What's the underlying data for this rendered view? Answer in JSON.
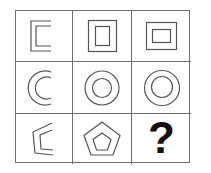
{
  "puzzle": {
    "type": "matrix-reasoning-3x3",
    "title": "",
    "grid": {
      "rows": 3,
      "columns": 3,
      "border_color": "#6e6e6e",
      "background_color": "#ffffff",
      "stroke_color": "#555555"
    },
    "cells": [
      {
        "id": "r1c1",
        "row": 1,
        "column": 1,
        "shape": "open-square-bracket-double-outline",
        "description": "Square outline with right side removed, drawn as double contour (bracket)",
        "filled": false,
        "label": ""
      },
      {
        "id": "r1c2",
        "row": 1,
        "column": 2,
        "shape": "square-with-inner-portrait-rectangle",
        "description": "Square outline containing a taller-than-wide inner rectangle",
        "filled": false,
        "label": ""
      },
      {
        "id": "r1c3",
        "row": 1,
        "column": 3,
        "shape": "square-with-inner-landscape-rectangle",
        "description": "Square outline containing a wider-than-tall inner rectangle",
        "filled": false,
        "label": ""
      },
      {
        "id": "r2c1",
        "row": 2,
        "column": 1,
        "shape": "double-arc-open-circle",
        "description": "Two nested arcs forming an open circle facing right",
        "filled": false,
        "label": ""
      },
      {
        "id": "r2c2",
        "row": 2,
        "column": 2,
        "shape": "circle-with-small-inner-circle",
        "description": "Circle outline containing a smaller concentric circle",
        "filled": false,
        "label": ""
      },
      {
        "id": "r2c3",
        "row": 2,
        "column": 3,
        "shape": "circle-with-large-inner-circle",
        "description": "Circle outline containing a larger concentric circle",
        "filled": false,
        "label": ""
      },
      {
        "id": "r3c1",
        "row": 3,
        "column": 1,
        "shape": "open-pentagon-double-outline",
        "description": "Pentagon outline with right side open, drawn as double contour",
        "filled": false,
        "label": ""
      },
      {
        "id": "r3c2",
        "row": 3,
        "column": 2,
        "shape": "pentagon-with-inner-pentagon",
        "description": "Pentagon outline containing a smaller concentric pentagon",
        "filled": false,
        "label": ""
      },
      {
        "id": "r3c3",
        "row": 3,
        "column": 3,
        "shape": "question-mark",
        "description": "Bold question mark marking the missing answer cell",
        "filled": false,
        "label": "?"
      }
    ]
  }
}
